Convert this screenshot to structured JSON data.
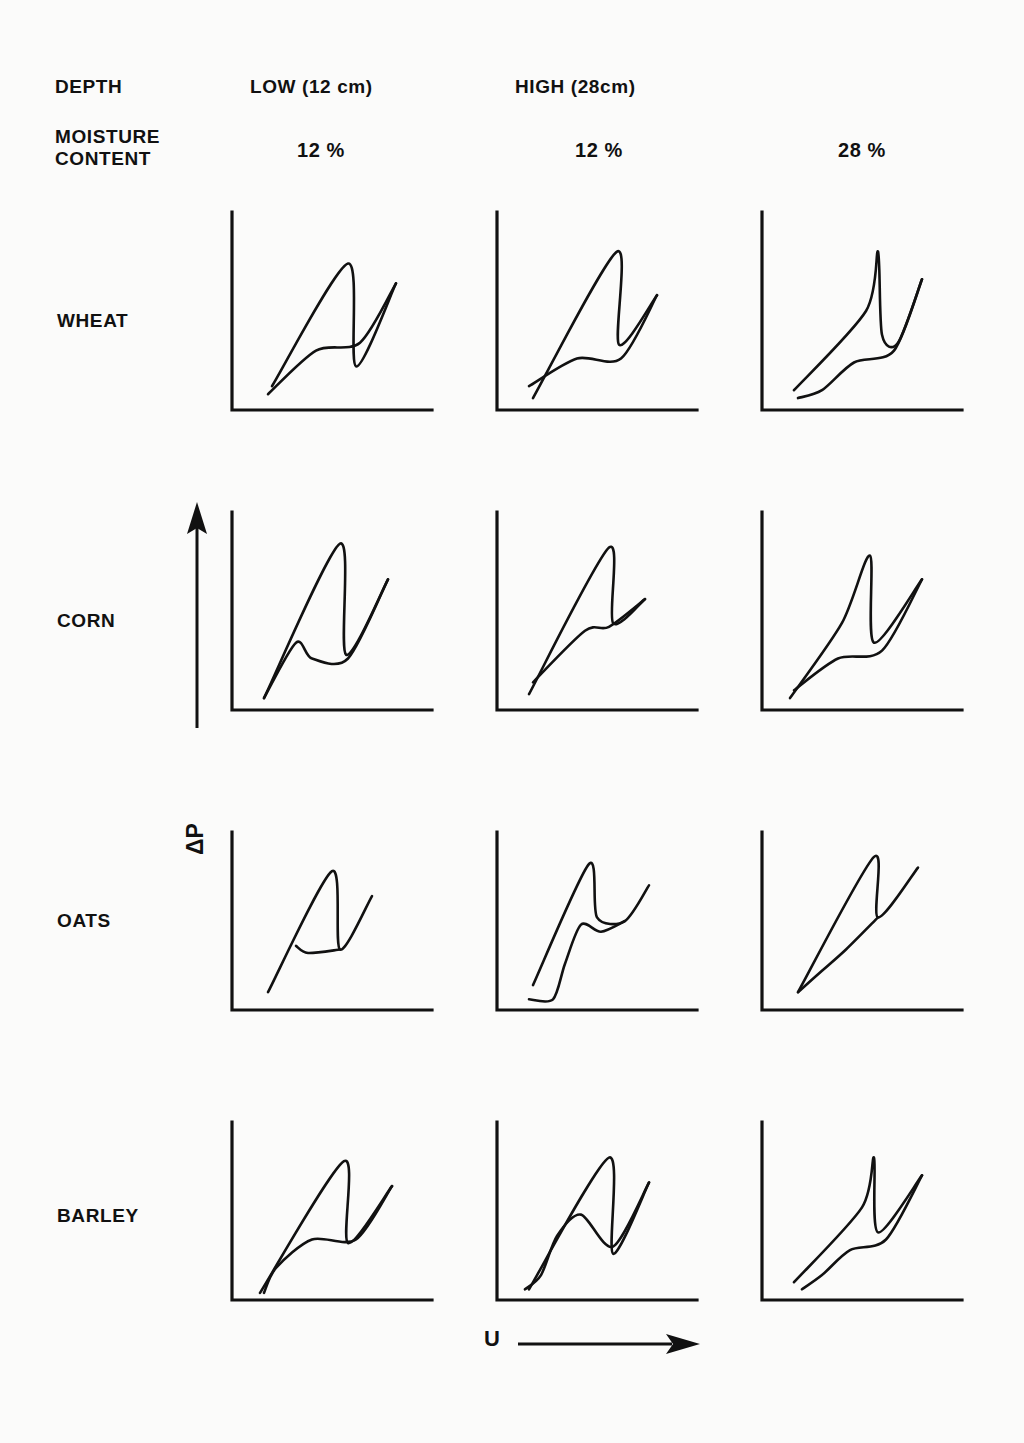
{
  "figure": {
    "background_color": "#fbfbfa",
    "ink_color": "#111111",
    "row_key_label": "DEPTH",
    "row_key_label2": "MOISTURE\nCONTENT",
    "y_axis_label": "ΔP",
    "x_axis_label": "U"
  },
  "columns": [
    {
      "depth": "LOW (12 cm)",
      "moisture": "12 %"
    },
    {
      "depth": "HIGH (28cm)",
      "moisture": "12 %"
    },
    {
      "depth": "",
      "moisture": "28 %"
    }
  ],
  "rows": [
    {
      "label": "WHEAT"
    },
    {
      "label": "CORN"
    },
    {
      "label": "OATS"
    },
    {
      "label": "BARLEY"
    }
  ],
  "chart_data": {
    "type": "line",
    "title": "",
    "xlabel": "U",
    "ylabel": "ΔP",
    "grid": false,
    "legend": "none",
    "axis_style": "L-shaped bare axes, no tick marks, no numeric scale",
    "panels": [
      {
        "row": "WHEAT",
        "col_depth": "LOW (12 cm)",
        "col_moisture": "12 %",
        "loading": [
          [
            0.2,
            0.12
          ],
          [
            0.58,
            0.74
          ],
          [
            0.62,
            0.22
          ],
          [
            0.82,
            0.64
          ]
        ],
        "unloading": [
          [
            0.82,
            0.64
          ],
          [
            0.64,
            0.34
          ],
          [
            0.42,
            0.3
          ],
          [
            0.18,
            0.08
          ]
        ]
      },
      {
        "row": "WHEAT",
        "col_depth": "HIGH (28cm)",
        "col_moisture": "12 %",
        "loading": [
          [
            0.18,
            0.06
          ],
          [
            0.6,
            0.8
          ],
          [
            0.61,
            0.33
          ],
          [
            0.8,
            0.58
          ]
        ],
        "unloading": [
          [
            0.8,
            0.58
          ],
          [
            0.62,
            0.26
          ],
          [
            0.4,
            0.26
          ],
          [
            0.16,
            0.12
          ]
        ]
      },
      {
        "row": "WHEAT",
        "col_depth": "HIGH (28cm)",
        "col_moisture": "28 %",
        "loading": [
          [
            0.16,
            0.1
          ],
          [
            0.52,
            0.5
          ],
          [
            0.58,
            0.8
          ],
          [
            0.6,
            0.38
          ],
          [
            0.68,
            0.34
          ],
          [
            0.8,
            0.66
          ]
        ],
        "unloading": [
          [
            0.8,
            0.66
          ],
          [
            0.66,
            0.3
          ],
          [
            0.46,
            0.24
          ],
          [
            0.3,
            0.1
          ],
          [
            0.18,
            0.06
          ]
        ]
      },
      {
        "row": "CORN",
        "col_depth": "LOW (12 cm)",
        "col_moisture": "12 %",
        "loading": [
          [
            0.16,
            0.06
          ],
          [
            0.54,
            0.84
          ],
          [
            0.57,
            0.28
          ],
          [
            0.78,
            0.66
          ]
        ],
        "unloading": [
          [
            0.78,
            0.66
          ],
          [
            0.58,
            0.26
          ],
          [
            0.4,
            0.26
          ],
          [
            0.32,
            0.34
          ],
          [
            0.16,
            0.06
          ]
        ]
      },
      {
        "row": "CORN",
        "col_depth": "HIGH (28cm)",
        "col_moisture": "12 %",
        "loading": [
          [
            0.16,
            0.08
          ],
          [
            0.56,
            0.82
          ],
          [
            0.58,
            0.44
          ],
          [
            0.74,
            0.56
          ]
        ],
        "unloading": [
          [
            0.74,
            0.56
          ],
          [
            0.56,
            0.42
          ],
          [
            0.44,
            0.4
          ],
          [
            0.18,
            0.14
          ]
        ]
      },
      {
        "row": "CORN",
        "col_depth": "HIGH (28cm)",
        "col_moisture": "28 %",
        "loading": [
          [
            0.14,
            0.06
          ],
          [
            0.4,
            0.44
          ],
          [
            0.54,
            0.78
          ],
          [
            0.56,
            0.34
          ],
          [
            0.8,
            0.66
          ]
        ],
        "unloading": [
          [
            0.8,
            0.66
          ],
          [
            0.6,
            0.3
          ],
          [
            0.38,
            0.26
          ],
          [
            0.16,
            0.1
          ]
        ]
      },
      {
        "row": "OATS",
        "col_depth": "LOW (12 cm)",
        "col_moisture": "12 %",
        "loading": [
          [
            0.18,
            0.1
          ],
          [
            0.5,
            0.78
          ],
          [
            0.54,
            0.34
          ],
          [
            0.7,
            0.64
          ]
        ],
        "unloading": [
          [
            0.54,
            0.34
          ],
          [
            0.38,
            0.32
          ],
          [
            0.32,
            0.36
          ]
        ]
      },
      {
        "row": "OATS",
        "col_depth": "HIGH (28cm)",
        "col_moisture": "12 %",
        "loading": [
          [
            0.18,
            0.14
          ],
          [
            0.46,
            0.82
          ],
          [
            0.5,
            0.52
          ],
          [
            0.64,
            0.5
          ],
          [
            0.76,
            0.7
          ]
        ],
        "unloading": [
          [
            0.64,
            0.5
          ],
          [
            0.52,
            0.44
          ],
          [
            0.42,
            0.48
          ],
          [
            0.34,
            0.26
          ],
          [
            0.28,
            0.06
          ],
          [
            0.16,
            0.06
          ]
        ]
      },
      {
        "row": "OATS",
        "col_depth": "HIGH (28cm)",
        "col_moisture": "28 %",
        "loading": [
          [
            0.18,
            0.1
          ],
          [
            0.56,
            0.86
          ],
          [
            0.58,
            0.52
          ],
          [
            0.78,
            0.8
          ]
        ],
        "unloading": [
          [
            0.58,
            0.52
          ],
          [
            0.42,
            0.34
          ],
          [
            0.3,
            0.22
          ],
          [
            0.18,
            0.1
          ]
        ]
      },
      {
        "row": "BARLEY",
        "col_depth": "LOW (12 cm)",
        "col_moisture": "12 %",
        "loading": [
          [
            0.14,
            0.04
          ],
          [
            0.56,
            0.78
          ],
          [
            0.58,
            0.32
          ],
          [
            0.8,
            0.64
          ]
        ],
        "unloading": [
          [
            0.8,
            0.64
          ],
          [
            0.62,
            0.34
          ],
          [
            0.4,
            0.34
          ],
          [
            0.22,
            0.18
          ],
          [
            0.16,
            0.04
          ]
        ]
      },
      {
        "row": "BARLEY",
        "col_depth": "HIGH (28cm)",
        "col_moisture": "12 %",
        "loading": [
          [
            0.16,
            0.06
          ],
          [
            0.56,
            0.8
          ],
          [
            0.58,
            0.26
          ],
          [
            0.76,
            0.66
          ]
        ],
        "unloading": [
          [
            0.76,
            0.66
          ],
          [
            0.58,
            0.3
          ],
          [
            0.42,
            0.48
          ],
          [
            0.3,
            0.36
          ],
          [
            0.22,
            0.14
          ],
          [
            0.14,
            0.06
          ]
        ]
      },
      {
        "row": "BARLEY",
        "col_depth": "HIGH (28cm)",
        "col_moisture": "28 %",
        "loading": [
          [
            0.16,
            0.1
          ],
          [
            0.5,
            0.52
          ],
          [
            0.56,
            0.8
          ],
          [
            0.58,
            0.38
          ],
          [
            0.8,
            0.7
          ]
        ],
        "unloading": [
          [
            0.8,
            0.7
          ],
          [
            0.62,
            0.34
          ],
          [
            0.44,
            0.28
          ],
          [
            0.3,
            0.14
          ],
          [
            0.2,
            0.06
          ]
        ]
      }
    ]
  }
}
